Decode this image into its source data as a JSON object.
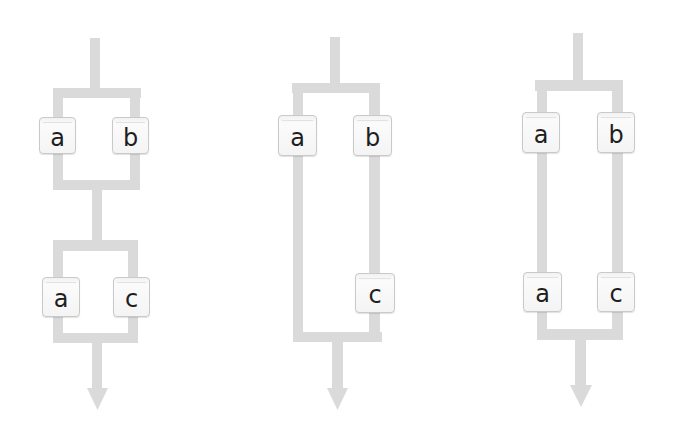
{
  "diagrams": [
    {
      "name": "series-of-parallel-pairs",
      "boxes": [
        {
          "label": "a",
          "x": 39,
          "y": 117,
          "w": 37,
          "h": 37
        },
        {
          "label": "b",
          "x": 112,
          "y": 117,
          "w": 37,
          "h": 37
        },
        {
          "label": "a",
          "x": 42,
          "y": 277,
          "w": 38,
          "h": 40
        },
        {
          "label": "c",
          "x": 113,
          "y": 277,
          "w": 37,
          "h": 40
        }
      ]
    },
    {
      "name": "parallel-a-and-series-b-c",
      "boxes": [
        {
          "label": "a",
          "x": 278,
          "y": 115,
          "w": 39,
          "h": 41
        },
        {
          "label": "b",
          "x": 353,
          "y": 115,
          "w": 39,
          "h": 41
        },
        {
          "label": "c",
          "x": 355,
          "y": 273,
          "w": 40,
          "h": 40
        }
      ]
    },
    {
      "name": "parallel-series-pairs",
      "boxes": [
        {
          "label": "a",
          "x": 522,
          "y": 112,
          "w": 38,
          "h": 41
        },
        {
          "label": "b",
          "x": 597,
          "y": 112,
          "w": 38,
          "h": 41
        },
        {
          "label": "a",
          "x": 523,
          "y": 272,
          "w": 39,
          "h": 40
        },
        {
          "label": "c",
          "x": 597,
          "y": 272,
          "w": 38,
          "h": 40
        }
      ]
    }
  ],
  "colors": {
    "wire": "#dadada",
    "box_border": "#c9c9c9",
    "text": "#1e1e1e"
  }
}
